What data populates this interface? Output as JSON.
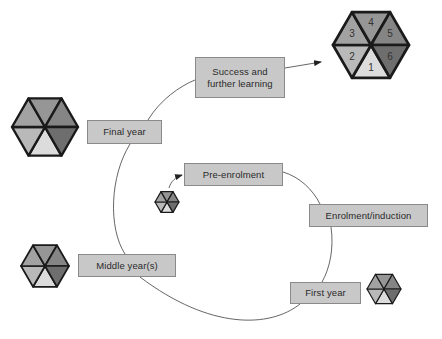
{
  "diagram": {
    "type": "cycle",
    "stages": [
      {
        "id": "pre-enrolment",
        "label": "Pre-enrolment",
        "box": {
          "x": 184,
          "y": 163,
          "w": 99,
          "h": 23
        }
      },
      {
        "id": "enrolment-induction",
        "label": "Enrolment/induction",
        "box": {
          "x": 309,
          "y": 204,
          "w": 119,
          "h": 23
        }
      },
      {
        "id": "first-year",
        "label": "First year",
        "box": {
          "x": 290,
          "y": 282,
          "w": 71,
          "h": 22
        }
      },
      {
        "id": "middle-years",
        "label": "Middle year(s)",
        "box": {
          "x": 78,
          "y": 254,
          "w": 98,
          "h": 23
        }
      },
      {
        "id": "final-year",
        "label": "Final year",
        "box": {
          "x": 87,
          "y": 120,
          "w": 75,
          "h": 24
        }
      },
      {
        "id": "success",
        "label": "Success and\nfurther learning",
        "box": {
          "x": 195,
          "y": 57,
          "w": 90,
          "h": 41
        }
      }
    ],
    "hexagons": [
      {
        "id": "hex-outcome",
        "cx": 371,
        "cy": 45,
        "r": 38,
        "numbered": true
      },
      {
        "id": "hex-final-year",
        "cx": 45,
        "cy": 127,
        "r": 33,
        "numbered": false
      },
      {
        "id": "hex-pre-enrolment",
        "cx": 167,
        "cy": 202,
        "r": 12,
        "numbered": false
      },
      {
        "id": "hex-middle-years",
        "cx": 45,
        "cy": 266,
        "r": 24,
        "numbered": false
      },
      {
        "id": "hex-first-year",
        "cx": 384,
        "cy": 289,
        "r": 17,
        "numbered": false
      }
    ],
    "segment_labels": [
      "1",
      "2",
      "3",
      "4",
      "5",
      "6"
    ],
    "segment_colors": {
      "1": "#dcdcdc",
      "2": "#b9b9b9",
      "3": "#a2a2a2",
      "4": "#969696",
      "5": "#858585",
      "6": "#6e6e6e"
    },
    "colors": {
      "box_fill": "#c8c8c8",
      "box_border": "#8a8a8a",
      "line": "#555555",
      "hex_outline": "#1a1a1a"
    }
  }
}
